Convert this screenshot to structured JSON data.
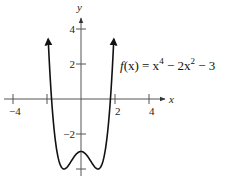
{
  "chart_data": {
    "type": "line",
    "title": "",
    "function_label": "f(x) = x^4 - 2x^2 - 3",
    "function_parts": {
      "lhs": "f",
      "arg": "(x) = x",
      "exp1": "4",
      "mid": " − 2x",
      "exp2": "2",
      "tail": " − 3"
    },
    "xlabel": "x",
    "ylabel": "y",
    "x_ticks": [
      {
        "value": -4,
        "label": "−4"
      },
      {
        "value": -2,
        "label": ""
      },
      {
        "value": 2,
        "label": "2"
      },
      {
        "value": 4,
        "label": "4"
      }
    ],
    "y_ticks": [
      {
        "value": 4,
        "label": "4"
      },
      {
        "value": 2,
        "label": "2"
      },
      {
        "value": -2,
        "label": "−2"
      },
      {
        "value": -4,
        "label": ""
      }
    ],
    "xlim": [
      -4.7,
      4.5
    ],
    "ylim": [
      -4.5,
      5
    ],
    "grid": false,
    "legend": "none",
    "series": [
      {
        "name": "f(x) = x^4 - 2x^2 - 3",
        "x": [
          -1.95,
          -1.75,
          -1.5,
          -1.25,
          -1.0,
          -0.75,
          -0.5,
          -0.25,
          0.0,
          0.25,
          0.5,
          0.75,
          1.0,
          1.25,
          1.5,
          1.75,
          1.95
        ],
        "y": [
          4.85,
          0.25,
          -2.44,
          -3.68,
          -4.0,
          -3.81,
          -3.44,
          -3.12,
          -3.0,
          -3.12,
          -3.44,
          -3.81,
          -4.0,
          -3.68,
          -2.44,
          0.25,
          4.85
        ]
      }
    ],
    "key_points": [
      {
        "x": -1,
        "y": -4,
        "kind": "local minimum"
      },
      {
        "x": 0,
        "y": -3,
        "kind": "local maximum"
      },
      {
        "x": 1,
        "y": -4,
        "kind": "local minimum"
      },
      {
        "x": -1.732,
        "y": 0,
        "kind": "x-intercept"
      },
      {
        "x": 1.732,
        "y": 0,
        "kind": "x-intercept"
      }
    ],
    "arrows": "both ends of the curve point upward"
  }
}
